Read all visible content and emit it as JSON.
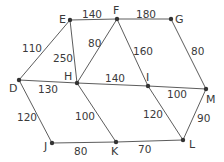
{
  "graph": {
    "nodes": [
      {
        "id": "E",
        "label": "E",
        "x": 70,
        "y": 20,
        "lx": 59,
        "ly": 23
      },
      {
        "id": "F",
        "label": "F",
        "x": 117,
        "y": 19,
        "lx": 113,
        "ly": 14
      },
      {
        "id": "G",
        "label": "G",
        "x": 171,
        "y": 19,
        "lx": 175,
        "ly": 23
      },
      {
        "id": "D",
        "label": "D",
        "x": 19,
        "y": 80,
        "lx": 9,
        "ly": 92
      },
      {
        "id": "H",
        "label": "H",
        "x": 77,
        "y": 83,
        "lx": 64,
        "ly": 80
      },
      {
        "id": "I",
        "label": "I",
        "x": 148,
        "y": 86,
        "lx": 146,
        "ly": 81
      },
      {
        "id": "M",
        "label": "M",
        "x": 206,
        "y": 89,
        "lx": 206,
        "ly": 103
      },
      {
        "id": "J",
        "label": "J",
        "x": 52,
        "y": 143,
        "lx": 44,
        "ly": 150
      },
      {
        "id": "K",
        "label": "K",
        "x": 116,
        "y": 142,
        "lx": 111,
        "ly": 155
      },
      {
        "id": "L",
        "label": "L",
        "x": 183,
        "y": 140,
        "lx": 189,
        "ly": 148
      }
    ],
    "edges": [
      {
        "from": "D",
        "to": "E",
        "weight": "110",
        "lx": 22,
        "ly": 52
      },
      {
        "from": "E",
        "to": "F",
        "weight": "140",
        "lx": 82,
        "ly": 18
      },
      {
        "from": "F",
        "to": "G",
        "weight": "180",
        "lx": 136,
        "ly": 18
      },
      {
        "from": "E",
        "to": "H",
        "weight": "250",
        "lx": 53,
        "ly": 62
      },
      {
        "from": "F",
        "to": "H",
        "weight": "80",
        "lx": 88,
        "ly": 47
      },
      {
        "from": "F",
        "to": "I",
        "weight": "160",
        "lx": 133,
        "ly": 55
      },
      {
        "from": "G",
        "to": "M",
        "weight": "80",
        "lx": 191,
        "ly": 55
      },
      {
        "from": "D",
        "to": "H",
        "weight": "130",
        "lx": 38,
        "ly": 93
      },
      {
        "from": "H",
        "to": "I",
        "weight": "140",
        "lx": 105,
        "ly": 82
      },
      {
        "from": "I",
        "to": "M",
        "weight": "100",
        "lx": 167,
        "ly": 98
      },
      {
        "from": "D",
        "to": "J",
        "weight": "120",
        "lx": 17,
        "ly": 121
      },
      {
        "from": "H",
        "to": "K",
        "weight": "100",
        "lx": 75,
        "ly": 120
      },
      {
        "from": "I",
        "to": "L",
        "weight": "120",
        "lx": 143,
        "ly": 118
      },
      {
        "from": "M",
        "to": "L",
        "weight": "90",
        "lx": 197,
        "ly": 122
      },
      {
        "from": "J",
        "to": "K",
        "weight": "80",
        "lx": 74,
        "ly": 155
      },
      {
        "from": "K",
        "to": "L",
        "weight": "70",
        "lx": 138,
        "ly": 153
      }
    ]
  }
}
